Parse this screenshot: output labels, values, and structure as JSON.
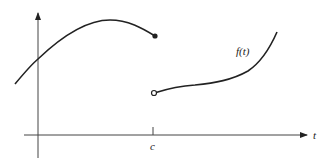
{
  "diagram": {
    "type": "piecewise-function-jump-discontinuity",
    "labels": {
      "function": "f(t)",
      "x_axis": "t",
      "discontinuity_point": "c"
    },
    "colors": {
      "stroke": "#222222",
      "background": "#ffffff"
    },
    "points": {
      "closed_endpoint": {
        "x": 155,
        "y": 36,
        "style": "filled"
      },
      "open_endpoint": {
        "x": 154,
        "y": 93,
        "style": "open"
      }
    }
  }
}
